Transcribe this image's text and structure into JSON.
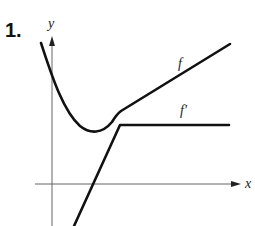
{
  "problem": {
    "number": "1."
  },
  "axes": {
    "x_label": "x",
    "y_label": "y"
  },
  "curves": [
    {
      "name": "f",
      "label": "f",
      "description": "decreasing curve, minimum, then linear increase"
    },
    {
      "name": "f_prime",
      "label": "f′",
      "description": "linear increase crossing x-axis, then constant (horizontal)"
    }
  ],
  "colors": {
    "curve": "#111111",
    "axis": "#666666",
    "background": "#ffffff"
  }
}
